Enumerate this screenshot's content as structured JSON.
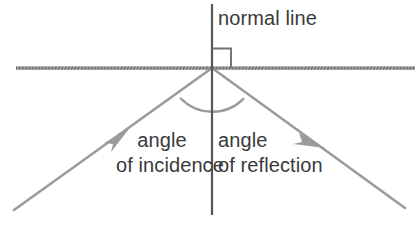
{
  "diagram": {
    "background_color": "#ffffff",
    "labels": {
      "normal_line": "normal line",
      "angle_of_incidence_line1": "angle",
      "angle_of_incidence_line2": "of incidence",
      "angle_of_reflection_line1": "angle",
      "angle_of_reflection_line2": "of reflection"
    },
    "colors": {
      "text": "#3a3a3c",
      "ray": "#9a9b9d",
      "normal_line": "#55565a",
      "surface_line": "#8e9094",
      "arc": "#9a9b9d",
      "right_angle_marker": "#6e7074"
    },
    "geometry": {
      "origin_x": 212,
      "origin_y": 68,
      "normal_line_top_y": 4,
      "normal_line_bottom_y": 215,
      "surface_line_x_start": 16,
      "surface_line_x_end": 415,
      "surface_line_y": 68,
      "incident_ray_start_x": 14,
      "incident_ray_start_y": 210,
      "reflected_ray_end_x": 405,
      "reflected_ray_end_y": 208,
      "arc_radius": 44,
      "right_angle_marker_size": 19
    }
  }
}
